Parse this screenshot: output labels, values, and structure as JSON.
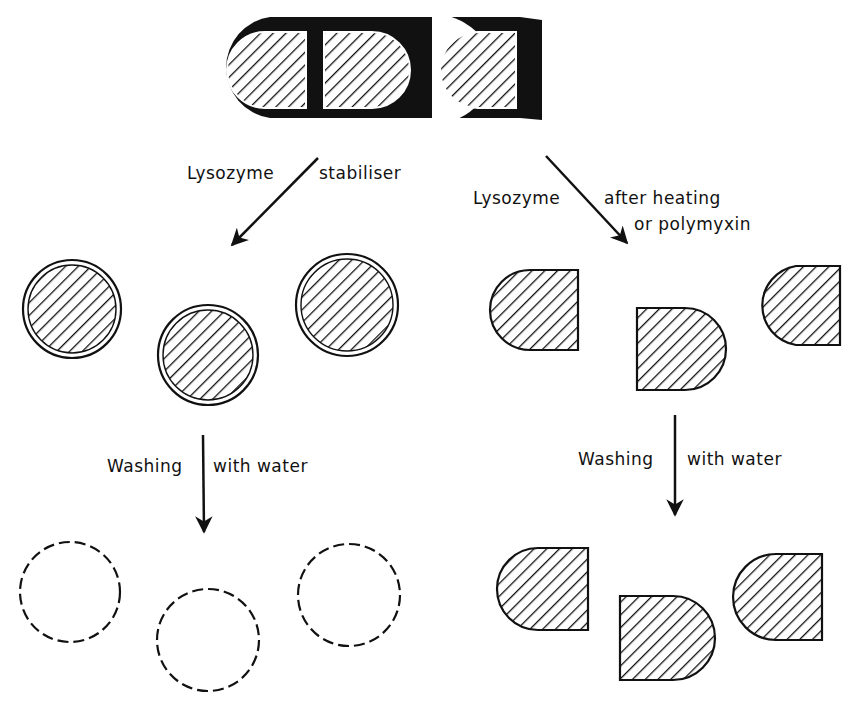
{
  "labels": {
    "left_top_a": "Lysozyme",
    "left_top_b": "stabiliser",
    "right_top_a": "Lysozyme",
    "right_top_b": "after heating",
    "right_top_c": "or polymyxin",
    "left_mid_a": "Washing",
    "left_mid_b": "with water",
    "right_mid_a": "Washing",
    "right_mid_b": "with water"
  },
  "colors": {
    "ink": "#111111",
    "paper": "#ffffff"
  }
}
